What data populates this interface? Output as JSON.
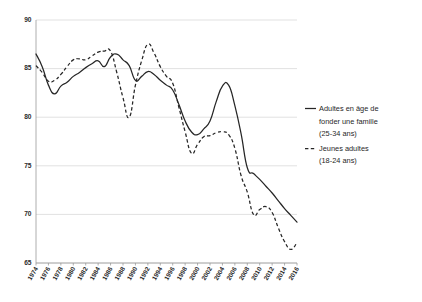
{
  "chart": {
    "type": "line",
    "title": "",
    "subtitle": "",
    "xlabel": "",
    "ylabel": "",
    "ylim": [
      65,
      90
    ],
    "ytick_step": 5,
    "grid": true,
    "legend_position": "right"
  },
  "axis": {
    "y_ticks": [
      "90",
      "85",
      "80",
      "75",
      "70",
      "65"
    ],
    "x_ticks": [
      "1974",
      "1976",
      "1978",
      "1980",
      "1982",
      "1984",
      "1986",
      "1988",
      "1990",
      "1992",
      "1994",
      "1996",
      "1998",
      "2000",
      "2002",
      "2004",
      "2006",
      "2008",
      "2010",
      "2012",
      "2014",
      "2016"
    ]
  },
  "legend": {
    "items": [
      {
        "style": "solid",
        "line1": "Adultes en âge de",
        "line2": "fonder une famille",
        "line3": "(25-34 ans)"
      },
      {
        "style": "dashed",
        "line1": "Jeunes adultes",
        "line2": "(18-24 ans)",
        "line3": ""
      }
    ]
  },
  "colors": {
    "line": "#262626",
    "grid": "#d4d4d4",
    "axis": "#9a9a9a",
    "background": "#ffffff",
    "text": "#1f1f1f"
  },
  "chart_data": {
    "type": "line",
    "title": "",
    "xlabel": "",
    "ylabel": "",
    "ylim": [
      65,
      90
    ],
    "xlim": [
      1974,
      2016
    ],
    "grid": true,
    "legend_position": "right",
    "x": [
      1974,
      1975,
      1976,
      1977,
      1978,
      1979,
      1980,
      1981,
      1982,
      1983,
      1984,
      1985,
      1986,
      1987,
      1988,
      1989,
      1990,
      1991,
      1992,
      1993,
      1994,
      1995,
      1996,
      1997,
      1998,
      1999,
      2000,
      2001,
      2002,
      2003,
      2004,
      2005,
      2006,
      2007,
      2008,
      2009,
      2010,
      2011,
      2012,
      2013,
      2014,
      2015,
      2016
    ],
    "series": [
      {
        "name": "Adultes en âge de fonder une famille (25-34 ans)",
        "style": "solid",
        "values": [
          86.5,
          85.2,
          83.3,
          82.4,
          83.2,
          83.6,
          84.2,
          84.6,
          85.1,
          85.5,
          85.8,
          85.2,
          86.2,
          86.5,
          85.9,
          85.3,
          83.8,
          84.2,
          84.7,
          84.4,
          83.8,
          83.3,
          82.8,
          81.3,
          79.6,
          78.5,
          78.2,
          78.8,
          79.6,
          81.6,
          83.2,
          83.3,
          81.2,
          78.3,
          74.8,
          74.2,
          73.6,
          72.9,
          72.2,
          71.4,
          70.6,
          69.9,
          69.2
        ]
      },
      {
        "name": "Jeunes adultes (18-24 ans)",
        "style": "dashed",
        "values": [
          85.3,
          84.6,
          83.7,
          83.8,
          84.4,
          85.2,
          85.9,
          86.0,
          85.9,
          86.3,
          86.7,
          86.8,
          86.8,
          84.6,
          82.0,
          80.0,
          83.3,
          85.8,
          87.5,
          86.6,
          85.2,
          84.2,
          83.5,
          81.0,
          78.5,
          76.3,
          77.2,
          78.0,
          78.1,
          78.4,
          78.5,
          78.2,
          76.8,
          74.0,
          72.3,
          70.0,
          70.5,
          70.8,
          70.2,
          68.6,
          67.2,
          66.4,
          67.1
        ]
      }
    ]
  }
}
